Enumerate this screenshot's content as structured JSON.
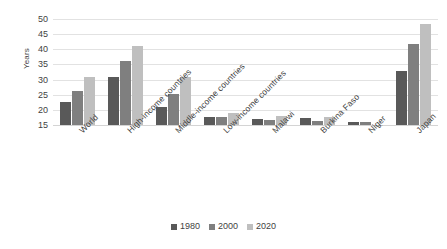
{
  "chart_data": {
    "type": "bar",
    "title": "",
    "xlabel": "",
    "ylabel": "Years",
    "ylim": [
      15,
      50
    ],
    "yticks": [
      15,
      20,
      25,
      30,
      35,
      40,
      45,
      50
    ],
    "ytick_labels": [
      "15",
      "20",
      "25",
      "30",
      "35",
      "40",
      "45",
      "50"
    ],
    "grid": true,
    "legend_position": "bottom",
    "categories": [
      "World",
      "High-income countries",
      "Middle-income countries",
      "Low-income countries",
      "Malawi",
      "Burkina Faso",
      "Niger",
      "Japan"
    ],
    "series": [
      {
        "name": "1980",
        "color": "#595959",
        "values": [
          22.5,
          30.8,
          20.8,
          17.7,
          17.1,
          17.2,
          16.1,
          32.8
        ]
      },
      {
        "name": "2000",
        "color": "#7f7f7f",
        "values": [
          26.3,
          36.1,
          25.2,
          17.5,
          16.8,
          16.4,
          16.0,
          41.6
        ]
      },
      {
        "name": "2020",
        "color": "#bfbfbf",
        "values": [
          30.8,
          41.1,
          30.8,
          19.0,
          18.1,
          17.7,
          15.1,
          48.5
        ]
      }
    ]
  },
  "legend": {
    "items": [
      {
        "label": "1980",
        "color": "#595959"
      },
      {
        "label": "2000",
        "color": "#7f7f7f"
      },
      {
        "label": "2020",
        "color": "#bfbfbf"
      }
    ]
  },
  "axis": {
    "y_title": "Years"
  }
}
